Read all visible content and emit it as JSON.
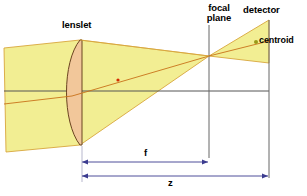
{
  "figure": {
    "type": "optical-ray-diagram",
    "title_visible": false,
    "background_color": "#ffffff"
  },
  "labels": {
    "lenslet": "lenslet",
    "focal_plane_line1": "focal",
    "focal_plane_line2": "plane",
    "detector": "detector",
    "centroid": "centroid",
    "focal_length": "f",
    "distance_z": "z"
  },
  "colors": {
    "beam_fill": "#f2ee93",
    "beam_stroke": "#d8a63c",
    "lens_fill": "#f2c79a",
    "lens_stroke": "#8a5a2a",
    "ray": "#c8721a",
    "axis": "#555555",
    "plane_line": "#666666",
    "dimension_line": "#3b3b8f",
    "centroid_dot": "#9a9a18",
    "focus_dot": "#d42a00",
    "text": "#000000"
  },
  "elements": {
    "optical_axis": {
      "y": 91,
      "x_start": 4,
      "x_end": 269
    },
    "focal_plane": {
      "x": 209,
      "y_top": 25,
      "y_bottom": 158
    },
    "detector_plane": {
      "x": 269,
      "y_top": 20,
      "y_bottom": 178
    },
    "lenslet": {
      "x": 80,
      "y_top": 40,
      "y_bottom": 145,
      "shape": "plano-convex"
    },
    "focus_point": {
      "x": 209,
      "y": 56
    },
    "centroid_point": {
      "x": 256,
      "y": 42
    },
    "chief_ray_marker": {
      "x": 120,
      "y": 80
    },
    "dimension_f": {
      "y": 162,
      "x_start": 82,
      "x_end": 208
    },
    "dimension_z": {
      "y": 176,
      "x_start": 82,
      "x_end": 268
    }
  }
}
